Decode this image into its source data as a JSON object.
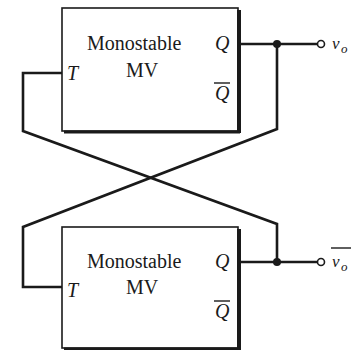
{
  "diagram": {
    "type": "circuit",
    "title": "",
    "blocks": [
      {
        "id": "top",
        "label_line1": "Monostable",
        "label_line2": "MV",
        "input": "T",
        "output_q": "Q",
        "output_qbar": "Q",
        "terminal_label": "v",
        "terminal_sub": "o"
      },
      {
        "id": "bottom",
        "label_line1": "Monostable",
        "label_line2": "MV",
        "input": "T",
        "output_q": "Q",
        "output_qbar": "Q",
        "terminal_label": "v",
        "terminal_sub": "o"
      }
    ],
    "connections": [
      "top.Q -> bottom.T (cross-coupled)",
      "bottom.Q -> top.T (cross-coupled)",
      "top.Q -> v_o",
      "bottom.Q -> v_o_bar"
    ],
    "colors": {
      "ink": "#1a1a1a",
      "background": "#ffffff"
    }
  }
}
